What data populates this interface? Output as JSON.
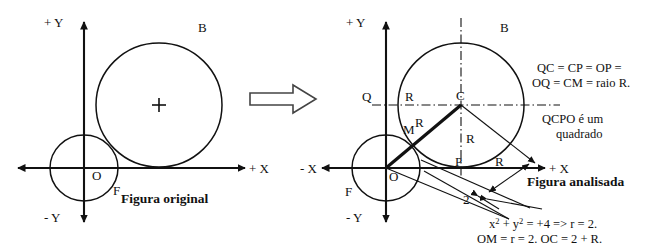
{
  "figure": {
    "title_left": "Figura original",
    "title_right": "Figura analisada",
    "transition_icon": "right-block-arrow-icon"
  },
  "left_diagram": {
    "axis_labels": {
      "y_positive": "+ Y",
      "y_negative": "- Y",
      "x_positive": "+ X"
    },
    "point_labels": {
      "origin": "O",
      "small_circle_tangent": "F",
      "big_circle": "B"
    },
    "center_mark": "plus-cross-icon"
  },
  "right_diagram": {
    "axis_labels": {
      "y_positive": "+ Y",
      "y_negative": "- Y",
      "x_positive": "+ X",
      "x_negative": "- X"
    },
    "point_labels": {
      "origin": "O",
      "small_circle_tangent": "F",
      "big_circle": "B",
      "center": "C",
      "left_quad": "Q",
      "foot_on_x": "P",
      "intersection": "M"
    },
    "radius_labels": {
      "top_horizontal": "R",
      "diagonal_upper": "R",
      "vertical_center": "R",
      "x_axis_right": "R"
    },
    "measure_label": "2"
  },
  "annotations": {
    "relation_line1": "QC = CP = OP =",
    "relation_line2": "OQ = CM = raio R.",
    "square_line1": "QCPO é um",
    "square_line2": "quadrado",
    "equation_line1_a": "x",
    "equation_line1_sup1": "2",
    "equation_line1_b": " + y",
    "equation_line1_sup2": "2",
    "equation_line1_c": " = +4 => r = 2.",
    "equation_line2": "OM = r = 2. OC = 2 + R."
  },
  "colors": {
    "ink": "#111111",
    "background": "#ffffff",
    "arrow_outline": "#444444"
  }
}
